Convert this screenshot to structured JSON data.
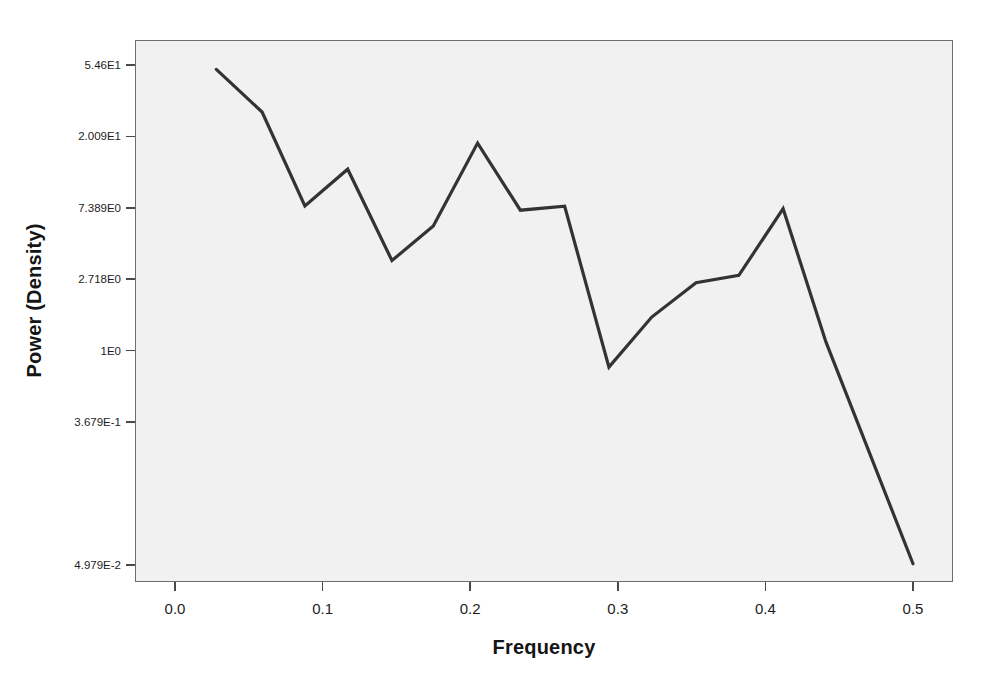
{
  "chart_data": {
    "type": "line",
    "title": "",
    "xlabel": "Frequency",
    "ylabel": "Power (Density)",
    "yscale": "log",
    "grid": false,
    "legend": false,
    "xlim": [
      -0.0271,
      0.5271
    ],
    "ylim": [
      0.0391,
      77.6
    ],
    "xticks": [
      0.0,
      0.1,
      0.2,
      0.3,
      0.4,
      0.5
    ],
    "xticklabels": [
      "0.0",
      "0.1",
      "0.2",
      "0.3",
      "0.4",
      "0.5"
    ],
    "yticks": [
      54.6,
      20.09,
      7.389,
      2.718,
      1.0,
      0.3679,
      0.04979
    ],
    "yticklabels": [
      "5.46E1",
      "2.009E1",
      "7.389E0",
      "2.718E0",
      "1E0",
      "3.679E-1",
      "4.979E-2"
    ],
    "series": [
      {
        "name": "Power (Density)",
        "color": "#333333",
        "x": [
          0.028,
          0.059,
          0.088,
          0.117,
          0.147,
          0.175,
          0.205,
          0.234,
          0.264,
          0.294,
          0.323,
          0.353,
          0.382,
          0.412,
          0.441,
          0.5
        ],
        "values": [
          51.4,
          28.3,
          7.59,
          12.7,
          3.53,
          5.73,
          18.3,
          7.15,
          7.56,
          0.794,
          1.6,
          2.59,
          2.87,
          7.3,
          1.13,
          0.0505
        ]
      }
    ]
  },
  "axes": {
    "x_title": "Frequency",
    "y_title": "Power (Density)"
  }
}
